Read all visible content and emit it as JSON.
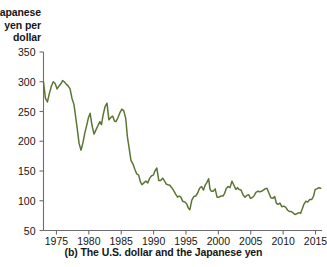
{
  "figure": {
    "caption": "(b) The U.S. dollar and the Japanese yen",
    "y_axis_title_lines": [
      "Japanese",
      "yen per",
      "dollar"
    ]
  },
  "chart_data": {
    "type": "line",
    "title": "",
    "subtitle": "",
    "xlabel": "",
    "ylabel": "Japanese yen per dollar",
    "legend": [],
    "legend_position": "none",
    "grid": false,
    "line_color": "#5c7535",
    "xlim": [
      1973,
      2016
    ],
    "ylim": [
      50,
      350
    ],
    "xticks": [
      1975,
      1980,
      1985,
      1990,
      1995,
      2000,
      2005,
      2010,
      2015
    ],
    "yticks": [
      50,
      100,
      150,
      200,
      250,
      300,
      350
    ],
    "xtick_labels": [
      "1975",
      "1980",
      "1985",
      "1990",
      "1995",
      "2000",
      "2005",
      "2010",
      "2015"
    ],
    "ytick_labels": [
      "50",
      "100",
      "150",
      "200",
      "250",
      "300",
      "350"
    ],
    "series": [
      {
        "name": "Japanese yen per U.S. dollar",
        "x": [
          1973.0,
          1973.3,
          1973.6,
          1973.9,
          1974.2,
          1974.5,
          1974.8,
          1975.1,
          1975.4,
          1975.7,
          1975.95,
          1976.2,
          1976.5,
          1976.8,
          1977.1,
          1977.4,
          1977.7,
          1977.95,
          1978.2,
          1978.5,
          1978.8,
          1979.1,
          1979.4,
          1979.7,
          1979.95,
          1980.2,
          1980.5,
          1980.8,
          1981.1,
          1981.4,
          1981.7,
          1981.95,
          1982.2,
          1982.5,
          1982.8,
          1983.1,
          1983.4,
          1983.7,
          1983.95,
          1984.2,
          1984.5,
          1984.8,
          1985.1,
          1985.4,
          1985.7,
          1985.95,
          1986.2,
          1986.5,
          1986.8,
          1987.1,
          1987.4,
          1987.7,
          1987.95,
          1988.2,
          1988.5,
          1988.8,
          1989.1,
          1989.4,
          1989.7,
          1989.95,
          1990.2,
          1990.5,
          1990.8,
          1991.1,
          1991.4,
          1991.7,
          1991.95,
          1992.2,
          1992.5,
          1992.8,
          1993.1,
          1993.4,
          1993.7,
          1993.95,
          1994.2,
          1994.5,
          1994.8,
          1995.1,
          1995.35,
          1995.6,
          1995.9,
          1996.2,
          1996.5,
          1996.8,
          1997.1,
          1997.4,
          1997.7,
          1997.95,
          1998.2,
          1998.5,
          1998.7,
          1998.9,
          1999.2,
          1999.5,
          1999.8,
          2000.1,
          2000.4,
          2000.7,
          2000.95,
          2001.2,
          2001.5,
          2001.8,
          2002.1,
          2002.4,
          2002.7,
          2002.95,
          2003.2,
          2003.5,
          2003.8,
          2004.1,
          2004.4,
          2004.7,
          2004.95,
          2005.2,
          2005.5,
          2005.8,
          2006.1,
          2006.4,
          2006.7,
          2006.95,
          2007.2,
          2007.5,
          2007.8,
          2008.1,
          2008.4,
          2008.7,
          2008.95,
          2009.2,
          2009.5,
          2009.8,
          2010.1,
          2010.4,
          2010.7,
          2010.95,
          2011.2,
          2011.5,
          2011.8,
          2012.1,
          2012.4,
          2012.7,
          2012.95,
          2013.2,
          2013.5,
          2013.8,
          2014.1,
          2014.4,
          2014.7,
          2014.95,
          2015.2,
          2015.5,
          2015.8
        ],
        "values": [
          300,
          272,
          266,
          280,
          292,
          300,
          297,
          288,
          293,
          297,
          302,
          300,
          296,
          293,
          288,
          272,
          262,
          242,
          222,
          196,
          185,
          198,
          215,
          228,
          240,
          247,
          226,
          212,
          219,
          226,
          233,
          228,
          244,
          258,
          264,
          236,
          240,
          242,
          234,
          233,
          240,
          248,
          254,
          251,
          238,
          208,
          190,
          168,
          162,
          153,
          145,
          143,
          132,
          127,
          130,
          133,
          130,
          138,
          142,
          143,
          150,
          155,
          134,
          134,
          138,
          133,
          128,
          127,
          126,
          122,
          117,
          111,
          106,
          108,
          106,
          99,
          98,
          95,
          88,
          85,
          101,
          107,
          108,
          113,
          121,
          124,
          118,
          126,
          130,
          137,
          120,
          116,
          116,
          120,
          106,
          106,
          108,
          108,
          112,
          120,
          124,
          122,
          133,
          126,
          119,
          122,
          119,
          118,
          110,
          106,
          109,
          110,
          104,
          105,
          108,
          114,
          116,
          115,
          116,
          118,
          120,
          121,
          113,
          105,
          104,
          107,
          96,
          94,
          96,
          90,
          91,
          89,
          84,
          82,
          82,
          80,
          77,
          78,
          80,
          79,
          86,
          94,
          99,
          98,
          102,
          102,
          108,
          119,
          120,
          122,
          121
        ]
      }
    ]
  }
}
